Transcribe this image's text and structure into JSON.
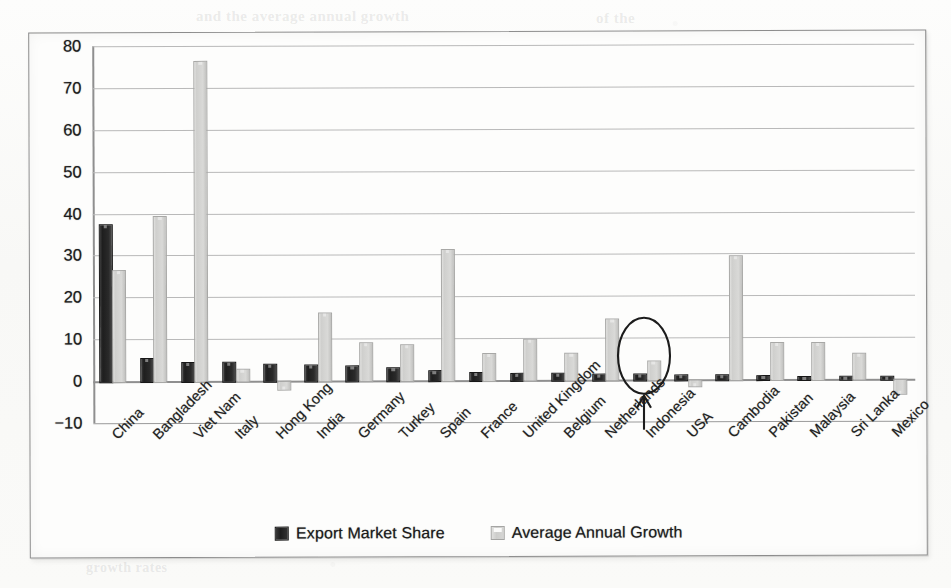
{
  "chart_data": {
    "type": "bar",
    "title": "",
    "subtitle": "",
    "xlabel": "",
    "ylabel": "",
    "categories": [
      "China",
      "Bangladesh",
      "Viet Nam",
      "Italy",
      "Hong Kong",
      "India",
      "Germany",
      "Turkey",
      "Spain",
      "France",
      "United Kingdom",
      "Belgium",
      "Netherlands",
      "Indonesia",
      "USA",
      "Cambodia",
      "Pakistan",
      "Malaysia",
      "Sri Lanka",
      "Mexico"
    ],
    "series": [
      {
        "name": "Export Market Share",
        "color": "#262626",
        "values": [
          37.5,
          5.6,
          4.6,
          4.6,
          4.0,
          3.8,
          3.6,
          3.1,
          2.3,
          2.0,
          1.7,
          1.7,
          1.5,
          1.5,
          1.2,
          1.2,
          0.9,
          0.8,
          0.8,
          0.7
        ]
      },
      {
        "name": "Average Annual Growth",
        "color": "#d4d4d2",
        "values": [
          26.5,
          39.5,
          76.3,
          2.8,
          -2.0,
          16.2,
          9.2,
          8.6,
          31.3,
          6.5,
          9.9,
          6.5,
          14.5,
          4.6,
          -1.5,
          29.6,
          8.9,
          8.9,
          6.2,
          -3.4
        ]
      }
    ],
    "ylim": [
      -10,
      80
    ],
    "yticks": [
      80,
      70,
      60,
      50,
      40,
      30,
      20,
      10,
      0,
      -10
    ],
    "ytick_labels": [
      "80",
      "70",
      "60",
      "50",
      "40",
      "30",
      "20",
      "10",
      "0",
      "−10"
    ],
    "grid": true,
    "legend_position": "bottom",
    "annotations": [
      {
        "kind": "ellipse-with-arrow",
        "target_category": "Indonesia",
        "label": ""
      }
    ]
  },
  "legend": {
    "items": [
      {
        "label": "Export Market Share",
        "swatch": "dark-square-swatch"
      },
      {
        "label": "Average Annual Growth",
        "swatch": "light-square-swatch"
      }
    ]
  },
  "page_bleed": [
    {
      "text": "and the average annual growth",
      "x": 196,
      "y": 8,
      "size": 15
    },
    {
      "text": "of the",
      "x": 596,
      "y": 10,
      "size": 15
    },
    {
      "text": "market share",
      "x": 48,
      "y": 150,
      "size": 15
    },
    {
      "text": "in the sector",
      "x": 640,
      "y": 196,
      "size": 15
    },
    {
      "text": "growth rates",
      "x": 86,
      "y": 560,
      "size": 14
    }
  ]
}
